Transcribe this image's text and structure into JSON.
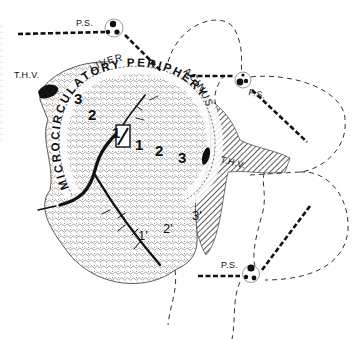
{
  "diagram": {
    "title_arc_top": "LIVER",
    "title_arc_right": "ACINUS",
    "ring_text": "MICROCIRCULATORY PERIPHERY",
    "portal_space_label": "P.S.",
    "terminal_hepatic_vein_label": "T.H.V.",
    "portal_spaces": [
      {
        "id": "ps-top",
        "label": "P.S."
      },
      {
        "id": "ps-right",
        "label": "P.S."
      },
      {
        "id": "ps-bottom",
        "label": "P.S."
      }
    ],
    "hepatic_veins": [
      {
        "id": "thv-left",
        "label": "T.H.V."
      },
      {
        "id": "thv-center",
        "label": "T.H.V."
      }
    ],
    "zones_simple_acinus": [
      {
        "id": "zone-1a",
        "label": "1"
      },
      {
        "id": "zone-1b",
        "label": "1"
      },
      {
        "id": "zone-2a",
        "label": "2"
      },
      {
        "id": "zone-2b",
        "label": "2"
      },
      {
        "id": "zone-3a",
        "label": "3"
      },
      {
        "id": "zone-3b",
        "label": "3"
      }
    ],
    "zones_adjacent_acinus": [
      {
        "id": "zone-1prime",
        "label": "1'"
      },
      {
        "id": "zone-2prime",
        "label": "2'"
      },
      {
        "id": "zone-3prime",
        "label": "3'"
      }
    ],
    "colors": {
      "ink": "#111111",
      "hatch": "#333333",
      "background": "#ffffff"
    }
  }
}
